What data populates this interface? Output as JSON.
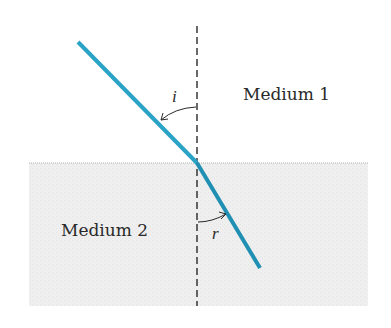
{
  "diagram": {
    "colors": {
      "ray": "#2aa3c6",
      "ray_refracted": "#1f8fb3",
      "medium2_fill": "#eeeeee",
      "interface": "#b0b0b0",
      "normal": "#2a2a2a",
      "text": "#2a2a2a"
    },
    "labels": {
      "medium1": "Medium 1",
      "medium2": "Medium 2",
      "angle_incidence": "i",
      "angle_refraction": "r"
    },
    "elements": [
      {
        "id": "incident-ray",
        "from": [
          78,
          42
        ],
        "to": [
          197,
          163
        ]
      },
      {
        "id": "refracted-ray",
        "from": [
          197,
          163
        ],
        "to": [
          260,
          268
        ]
      },
      {
        "id": "normal-line",
        "style": "dashed",
        "x": 197,
        "y_from": 26,
        "y_to": 306
      },
      {
        "id": "interface-line",
        "y": 163,
        "x_from": 29,
        "x_to": 368
      }
    ]
  }
}
